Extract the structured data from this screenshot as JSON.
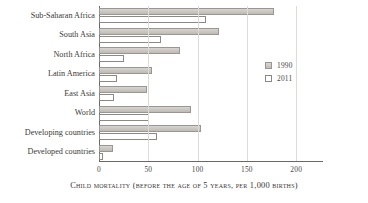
{
  "chart_data": {
    "type": "bar",
    "orientation": "horizontal",
    "title": "",
    "caption": "Child mortality (before the age of 5 years, per 1,000 births)",
    "xlabel": "",
    "ylabel": "",
    "xlim": [
      0,
      215
    ],
    "xticks": [
      0,
      50,
      100,
      150,
      200
    ],
    "xticklabels": [
      "0",
      "50",
      "100",
      "150",
      "200"
    ],
    "grid": true,
    "grid_axis": "x",
    "legend_position": "center-right",
    "categories": [
      "Sub-Saharan Africa",
      "South Asia",
      "North Africa",
      "Latin America",
      "East Asia",
      "World",
      "Developing countries",
      "Developed countries"
    ],
    "series": [
      {
        "name": "1990",
        "color": "#cbc8c2",
        "values": [
          177,
          122,
          82,
          54,
          49,
          93,
          103,
          14
        ]
      },
      {
        "name": "2011",
        "color": "#ffffff",
        "values": [
          109,
          63,
          25,
          18,
          15,
          51,
          59,
          4
        ]
      }
    ]
  },
  "legend": {
    "items": [
      {
        "label": "1990",
        "style": "filled"
      },
      {
        "label": "2011",
        "style": "hollow"
      }
    ]
  }
}
